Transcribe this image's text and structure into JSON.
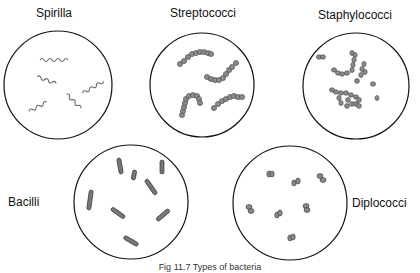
{
  "title": "Types of bacteria",
  "panels": [
    {
      "name": "Spirilla",
      "label": "Spirilla"
    },
    {
      "name": "Streptococci",
      "label": "Streptococci"
    },
    {
      "name": "Staphylococci",
      "label": "Staphylococci"
    },
    {
      "name": "Bacilli",
      "label": "Bacilli"
    },
    {
      "name": "Diplococci",
      "label": "Diplococci"
    }
  ],
  "caption": "Fig 11.7 Types of bacteria",
  "colors": {
    "outline": "#111111",
    "cell_fill": "#8a8a8a",
    "cell_stroke": "#444444"
  }
}
